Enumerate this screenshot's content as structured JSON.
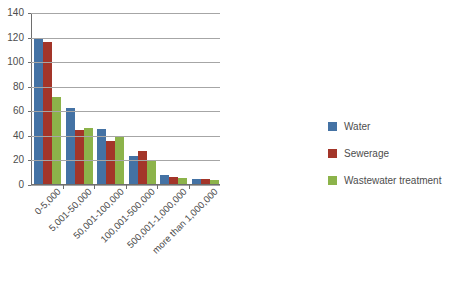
{
  "chart_data": {
    "type": "bar",
    "title": "",
    "subtitle": "",
    "xlabel": "",
    "ylabel": "",
    "ylim": [
      0,
      140
    ],
    "ytick_step": 20,
    "yticks": [
      "0",
      "20",
      "40",
      "60",
      "80",
      "100",
      "120",
      "140"
    ],
    "grid": true,
    "legend_position": "right",
    "categories": [
      "0-5,000",
      "5,001-50,000",
      "50,001-100,000",
      "100,001-500,000",
      "500,001-1,000,000",
      "more than 1,000,000"
    ],
    "series": [
      {
        "name": "Water",
        "color": "#4472a4",
        "values": [
          118,
          62,
          45,
          23,
          7,
          4
        ]
      },
      {
        "name": "Sewerage",
        "color": "#a33529",
        "values": [
          116,
          44,
          35,
          27,
          6,
          4
        ]
      },
      {
        "name": "Wastewater treatment",
        "color": "#8cb34a",
        "values": [
          71,
          46,
          38,
          19,
          5,
          3
        ]
      }
    ]
  },
  "colors": {
    "water": "#4472a4",
    "sewerage": "#a33529",
    "wastewater_treatment": "#8cb34a",
    "gridline": "#a6a6a6",
    "axis": "#6e6e6e",
    "text": "#4d4d4d",
    "background": "#ffffff"
  }
}
